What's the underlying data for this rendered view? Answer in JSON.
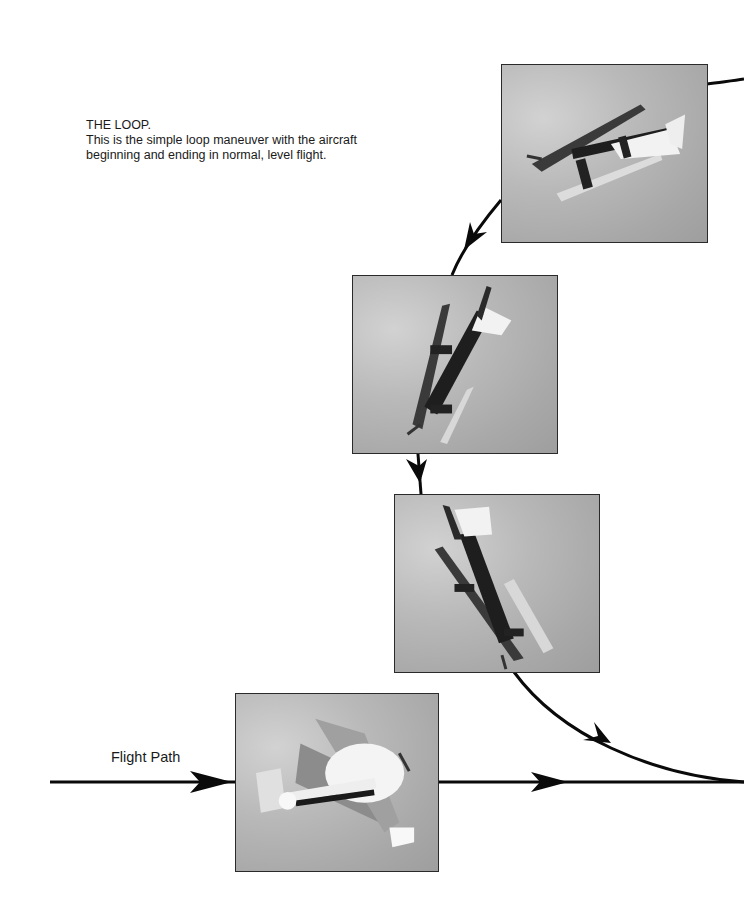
{
  "caption": {
    "title": "THE LOOP.",
    "line1": "This is the simple loop maneuver with the aircraft",
    "line2": "beginning and ending in normal, level flight."
  },
  "flight_path_label": "Flight Path",
  "photos": [
    {
      "id": "photo-1",
      "alt": "Biplane inverted at top of loop",
      "left": 501,
      "top": 64,
      "width": 207,
      "height": 179
    },
    {
      "id": "photo-2",
      "alt": "Biplane diving nose-down on back side of loop",
      "left": 352,
      "top": 275,
      "width": 206,
      "height": 179
    },
    {
      "id": "photo-3",
      "alt": "Biplane pulling out of dive",
      "left": 394,
      "top": 494,
      "width": 206,
      "height": 179
    },
    {
      "id": "photo-4",
      "alt": "Biplane in level flight entering loop",
      "left": 235,
      "top": 693,
      "width": 204,
      "height": 179
    }
  ],
  "colors": {
    "line": "#0a0a0a",
    "photo_border": "#2a2a2a",
    "sky": "#b4b4b4"
  }
}
